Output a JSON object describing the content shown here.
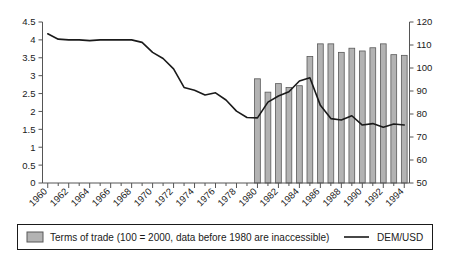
{
  "chart_data": {
    "type": "bar",
    "title": "",
    "subtitle": "",
    "xlabel": "",
    "ylabel": "",
    "grid": false,
    "legend_position": "bottom",
    "x": [
      1960,
      1961,
      1962,
      1963,
      1964,
      1965,
      1966,
      1967,
      1968,
      1969,
      1970,
      1971,
      1972,
      1973,
      1974,
      1975,
      1976,
      1977,
      1978,
      1979,
      1980,
      1981,
      1982,
      1983,
      1984,
      1985,
      1986,
      1987,
      1988,
      1989,
      1990,
      1991,
      1992,
      1993,
      1994
    ],
    "x_tick_labels": [
      "1960",
      "1962",
      "1964",
      "1966",
      "1968",
      "1970",
      "1972",
      "1974",
      "1976",
      "1978",
      "1980",
      "1982",
      "1984",
      "1986",
      "1988",
      "1990",
      "1992",
      "1994"
    ],
    "x_tick_values": [
      1960,
      1962,
      1964,
      1966,
      1968,
      1970,
      1972,
      1974,
      1976,
      1978,
      1980,
      1982,
      1984,
      1986,
      1988,
      1990,
      1992,
      1994
    ],
    "left_axis": {
      "label": "",
      "ylim": [
        0,
        4.5
      ],
      "ticks": [
        0,
        0.5,
        1,
        1.5,
        2,
        2.5,
        3,
        3.5,
        4,
        4.5
      ],
      "tick_labels": [
        "0",
        "0.5",
        "1",
        "1.5",
        "2",
        "2.5",
        "3",
        "3.5",
        "4",
        "4.5"
      ]
    },
    "right_axis": {
      "label": "",
      "ylim": [
        50,
        120
      ],
      "ticks": [
        50,
        60,
        70,
        80,
        90,
        100,
        110,
        120
      ],
      "tick_labels": [
        "50",
        "60",
        "70",
        "80",
        "90",
        "100",
        "110",
        "120"
      ]
    },
    "series": [
      {
        "name": "Terms of trade (100 = 2000, data before 1980 are inaccessible)",
        "short_name": "Terms of trade",
        "type": "bar",
        "axis": "right",
        "color": "#b3b3b3",
        "edge_color": "#595959",
        "x": [
          1980,
          1981,
          1982,
          1983,
          1984,
          1985,
          1986,
          1987,
          1988,
          1989,
          1990,
          1991,
          1992,
          1993,
          1994
        ],
        "values": [
          95.3,
          89.5,
          93.2,
          91.5,
          92.3,
          105.0,
          110.5,
          110.5,
          106.8,
          108.6,
          107.4,
          108.8,
          110.5,
          105.8,
          105.5
        ]
      },
      {
        "name": "DEM/USD",
        "short_name": "DEM/USD",
        "type": "line",
        "axis": "left",
        "color": "#1a1a1a",
        "x": [
          1960,
          1961,
          1962,
          1963,
          1964,
          1965,
          1966,
          1967,
          1968,
          1969,
          1970,
          1971,
          1972,
          1973,
          1974,
          1975,
          1976,
          1977,
          1978,
          1979,
          1980,
          1981,
          1982,
          1983,
          1984,
          1985,
          1986,
          1987,
          1988,
          1989,
          1990,
          1991,
          1992,
          1993,
          1994
        ],
        "values": [
          4.17,
          4.02,
          4.0,
          4.0,
          3.98,
          4.0,
          4.0,
          4.0,
          4.0,
          3.93,
          3.65,
          3.48,
          3.19,
          2.67,
          2.59,
          2.46,
          2.52,
          2.32,
          2.01,
          1.83,
          1.82,
          2.26,
          2.43,
          2.55,
          2.85,
          2.94,
          2.17,
          1.8,
          1.76,
          1.88,
          1.62,
          1.66,
          1.56,
          1.65,
          1.62
        ]
      }
    ]
  },
  "legend": {
    "entries": [
      {
        "marker": "bar-swatch",
        "label": "Terms of trade (100 = 2000, data before 1980 are inaccessible)"
      },
      {
        "marker": "line-swatch",
        "label": "DEM/USD"
      }
    ]
  }
}
